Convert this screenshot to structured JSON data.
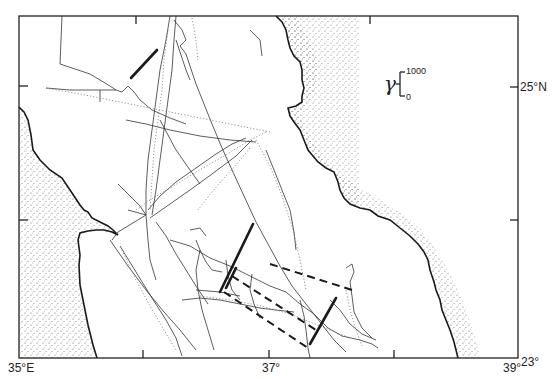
{
  "map": {
    "title": "",
    "labels": {
      "lon_left": "35°E",
      "lon_mid": "37°",
      "lon_right": "39°",
      "lat_bottom": "23°",
      "lat_top": "25°N"
    },
    "legend": {
      "symbol": "γ",
      "max_label": "1000",
      "min_label": "0"
    },
    "colors": {
      "frame": "#222222",
      "coast": "#1a1a1a",
      "stipple": "#555555",
      "track": "#333333",
      "dotted_track": "#777777",
      "anomaly_bar": "#1a1a1a"
    },
    "features": [
      {
        "type": "coastline",
        "side": "west"
      },
      {
        "type": "coastline",
        "side": "east"
      },
      {
        "type": "ship_tracks",
        "style": "solid and dotted"
      },
      {
        "type": "anomaly_bars",
        "count": 4,
        "style": "solid"
      },
      {
        "type": "dashed_lines",
        "count": 3
      }
    ]
  }
}
